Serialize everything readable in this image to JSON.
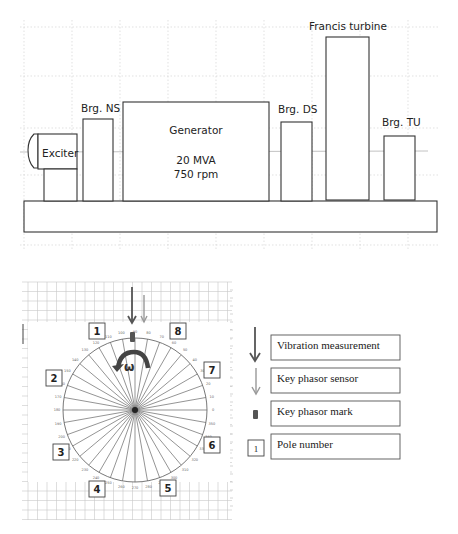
{
  "machine_layout": {
    "components": [
      {
        "id": "exciter",
        "label": "Exciter"
      },
      {
        "id": "bearing_ns",
        "label": "Brg. NS"
      },
      {
        "id": "generator",
        "label": "Generator",
        "rating": "20 MVA",
        "speed": "750 rpm"
      },
      {
        "id": "bearing_ds",
        "label": "Brg. DS"
      },
      {
        "id": "francis_turbine",
        "label": "Francis turbine"
      },
      {
        "id": "bearing_tu",
        "label": "Brg. TU"
      }
    ]
  },
  "rotor_diagram": {
    "rotation_symbol": "ω",
    "poles": [
      {
        "n": "1"
      },
      {
        "n": "2"
      },
      {
        "n": "3"
      },
      {
        "n": "4"
      },
      {
        "n": "5"
      },
      {
        "n": "6"
      },
      {
        "n": "7"
      },
      {
        "n": "8"
      }
    ],
    "degree_labels": [
      "0",
      "10",
      "20",
      "30",
      "40",
      "50",
      "60",
      "70",
      "80",
      "90",
      "100",
      "110",
      "120",
      "130",
      "140",
      "150",
      "160",
      "170",
      "180",
      "190",
      "200",
      "210",
      "220",
      "230",
      "240",
      "250",
      "260",
      "270",
      "280",
      "290",
      "300",
      "310",
      "320",
      "330",
      "340",
      "350"
    ],
    "spoke_count": 36
  },
  "legend": {
    "items": [
      {
        "symbol": "dark-arrow",
        "label": "Vibration measurement"
      },
      {
        "symbol": "light-arrow",
        "label": "Key phasor sensor"
      },
      {
        "symbol": "mark",
        "label": "Key phasor mark"
      },
      {
        "symbol": "pole-box",
        "symbol_text": "1",
        "label": "Pole number"
      }
    ]
  },
  "colors": {
    "line": "#333333",
    "vibration_arrow": "#555555",
    "keyphasor_arrow": "#9a9a9a",
    "grid": "#c8c8c8"
  }
}
